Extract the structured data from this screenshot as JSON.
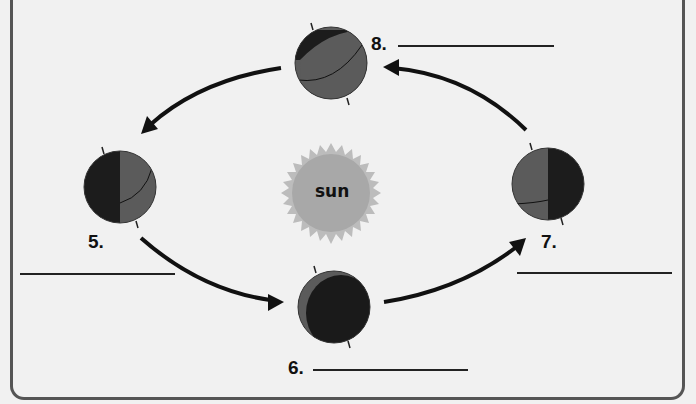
{
  "diagram": {
    "title": "",
    "sun": {
      "label": "sun",
      "color": "#a9a9a9",
      "ray_color": "#bdbdbd"
    },
    "colors": {
      "background": "#f1f1f1",
      "globe_lit": "#5a5a5a",
      "globe_dark": "#1a1a1a",
      "arrow": "#111111",
      "frame": "#555555"
    },
    "positions": [
      {
        "number": "5.",
        "side": "left",
        "answer": ""
      },
      {
        "number": "6.",
        "side": "bottom",
        "answer": ""
      },
      {
        "number": "7.",
        "side": "right",
        "answer": ""
      },
      {
        "number": "8.",
        "side": "top",
        "answer": ""
      }
    ],
    "orbit_direction": "counterclockwise (5 → 6 → 7 → 8 → 5)"
  }
}
